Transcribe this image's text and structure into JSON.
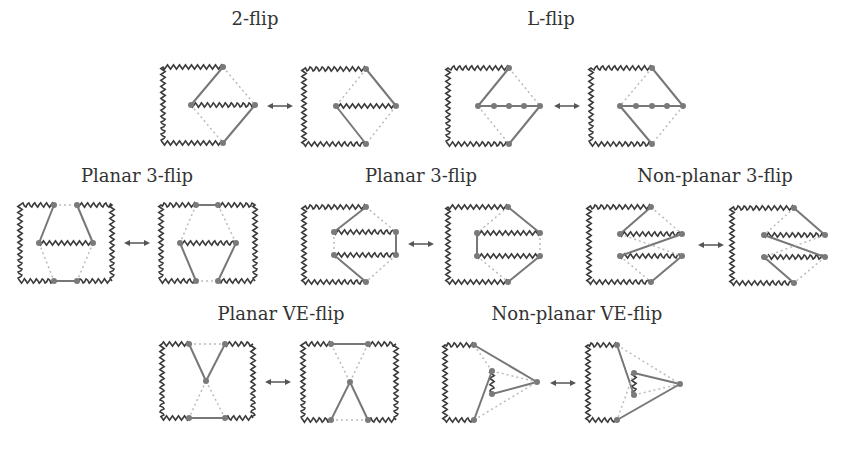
{
  "figure": {
    "panels": [
      {
        "id": "2-flip",
        "title": "2-flip",
        "arrow": "↔"
      },
      {
        "id": "l-flip",
        "title": "L-flip",
        "arrow": "↔"
      },
      {
        "id": "planar-3-flip-a",
        "title": "Planar 3-flip",
        "arrow": "↔"
      },
      {
        "id": "planar-3-flip-b",
        "title": "Planar 3-flip",
        "arrow": "↔"
      },
      {
        "id": "non-planar-3-flip",
        "title": "Non-planar 3-flip",
        "arrow": "↔"
      },
      {
        "id": "planar-ve-flip",
        "title": "Planar VE-flip",
        "arrow": "↔"
      },
      {
        "id": "non-planar-ve-flip",
        "title": "Non-planar VE-flip",
        "arrow": "↔"
      }
    ]
  }
}
